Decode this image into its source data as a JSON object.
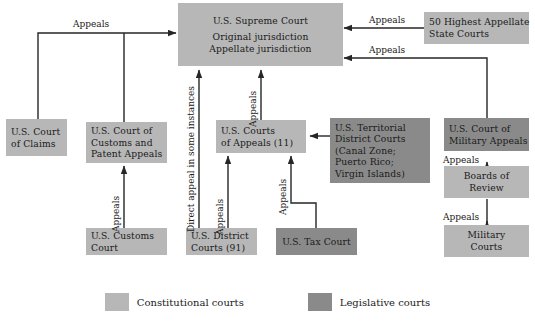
{
  "diagram": {
    "colors": {
      "constitutional": "#b7b7b7",
      "legislative": "#8a8a8a",
      "line": "#262626",
      "background": "#ffffff"
    },
    "nodes": [
      {
        "id": "supreme-court",
        "type": "constitutional",
        "lines": [
          "U.S. Supreme Court",
          "Original jurisdiction",
          "Appellate jurisdiction"
        ]
      },
      {
        "id": "state-courts",
        "type": "constitutional",
        "lines": [
          "50 Highest Appellate",
          "State Courts"
        ]
      },
      {
        "id": "court-of-claims",
        "type": "constitutional",
        "lines": [
          "U.S. Court",
          "of Claims"
        ]
      },
      {
        "id": "customs-patent-appeals",
        "type": "constitutional",
        "lines": [
          "U.S. Court of",
          "Customs and",
          "Patent Appeals"
        ]
      },
      {
        "id": "courts-of-appeals",
        "type": "constitutional",
        "lines": [
          "U.S. Courts",
          "of Appeals (11)"
        ]
      },
      {
        "id": "territorial-district-courts",
        "type": "legislative",
        "lines": [
          "U.S. Territorial",
          "District Courts",
          "(Canal Zone;",
          "Puerto Rico;",
          "Virgin Islands)"
        ]
      },
      {
        "id": "court-of-military-appeals",
        "type": "legislative",
        "lines": [
          "U.S. Court of",
          "Military Appeals"
        ]
      },
      {
        "id": "boards-of-review",
        "type": "constitutional",
        "lines": [
          "Boards of",
          "Review"
        ]
      },
      {
        "id": "customs-court",
        "type": "constitutional",
        "lines": [
          "U.S. Customs",
          "Court"
        ]
      },
      {
        "id": "district-courts",
        "type": "constitutional",
        "lines": [
          "U.S. District",
          "Courts (91)"
        ]
      },
      {
        "id": "tax-court",
        "type": "legislative",
        "lines": [
          "U.S. Tax Court"
        ]
      },
      {
        "id": "military-courts",
        "type": "constitutional",
        "lines": [
          "Military",
          "Courts"
        ]
      }
    ],
    "edge_labels": [
      {
        "id": "appeals-top-left",
        "text": "Appeals"
      },
      {
        "id": "appeals-state-1",
        "text": "Appeals"
      },
      {
        "id": "appeals-state-2",
        "text": "Appeals"
      },
      {
        "id": "direct-appeal",
        "text": "Direct appeal in some instances"
      },
      {
        "id": "appeals-courts-of-appeals-to-supreme",
        "text": "Appeals"
      },
      {
        "id": "appeals-customs-court",
        "text": "Appeals"
      },
      {
        "id": "appeals-district-courts",
        "text": "Appeals"
      },
      {
        "id": "appeals-tax-court",
        "text": "Appeals"
      },
      {
        "id": "appeals-boards-of-review",
        "text": "Appeals"
      },
      {
        "id": "appeals-military-courts",
        "text": "Appeals"
      }
    ],
    "legend": [
      {
        "id": "constitutional",
        "label": "Constitutional courts",
        "color": "#b7b7b7"
      },
      {
        "id": "legislative",
        "label": "Legislative courts",
        "color": "#8a8a8a"
      }
    ]
  }
}
